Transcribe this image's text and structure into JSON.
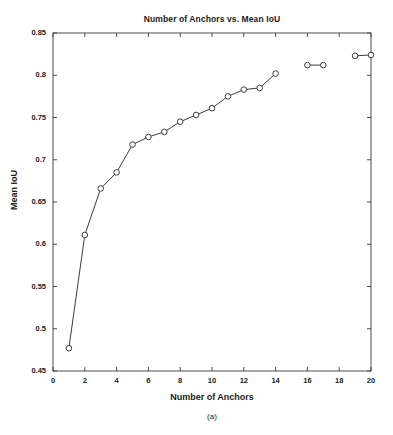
{
  "figure": {
    "caption": "(a)",
    "background_color": "#ffffff",
    "axis_color": "#4d4d4d",
    "line_color": "#3c3c3c",
    "marker_face_color": "#ffffff"
  },
  "chart_data": {
    "type": "line",
    "title": "Number of Anchors vs. Mean IoU",
    "xlabel": "Number of Anchors",
    "ylabel": "Mean IoU",
    "xlim": [
      0,
      20
    ],
    "ylim": [
      0.45,
      0.85
    ],
    "grid": false,
    "legend": null,
    "marker": "circle-open",
    "xticks": [
      0,
      2,
      4,
      6,
      8,
      10,
      12,
      14,
      16,
      18,
      20
    ],
    "xtick_labels": [
      "0",
      "2",
      "4",
      "6",
      "8",
      "10",
      "12",
      "14",
      "16",
      "18",
      "20"
    ],
    "yticks": [
      0.45,
      0.5,
      0.55,
      0.6,
      0.65,
      0.7,
      0.75,
      0.8,
      0.85
    ],
    "ytick_labels": [
      "0.45",
      "0.5",
      "0.55",
      "0.6",
      "0.65",
      "0.7",
      "0.75",
      "0.8",
      "0.85"
    ],
    "x": [
      1,
      2,
      3,
      4,
      5,
      6,
      7,
      8,
      9,
      10,
      11,
      12,
      13,
      14,
      16,
      17,
      19,
      20
    ],
    "y": [
      0.477,
      0.611,
      0.666,
      0.685,
      0.718,
      0.727,
      0.733,
      0.745,
      0.753,
      0.761,
      0.775,
      0.783,
      0.785,
      0.802,
      0.812,
      0.812,
      0.823,
      0.824
    ],
    "segments": [
      {
        "from_index": 0,
        "to_index": 13
      },
      {
        "from_index": 14,
        "to_index": 15
      },
      {
        "from_index": 16,
        "to_index": 17
      }
    ]
  }
}
